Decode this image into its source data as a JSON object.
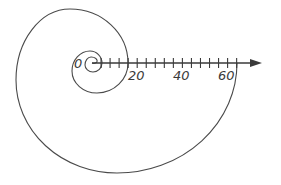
{
  "diagram": {
    "type": "polar-spiral",
    "colors": {
      "curve": "#4a4a4a",
      "axis": "#3a3a3a",
      "background": "#ffffff"
    },
    "axis": {
      "origin_label": "0",
      "tick_step_units": 4,
      "max_tick_units": 64,
      "labels": [
        {
          "value": 20,
          "text": "20"
        },
        {
          "value": 40,
          "text": "40"
        },
        {
          "value": 60,
          "text": "60"
        }
      ],
      "arrow": "right"
    },
    "spiral": {
      "turns": 3,
      "axis_crossings": [
        0,
        16,
        64
      ],
      "direction": "counterclockwise"
    }
  }
}
